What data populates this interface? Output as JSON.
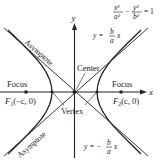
{
  "diagram": {
    "equation": {
      "x_term_num": "x²",
      "x_term_den": "a²",
      "minus": "−",
      "y_term_num": "y²",
      "y_term_den": "b²",
      "rhs": "= 1"
    },
    "axes": {
      "x_label": "x",
      "y_label": "y"
    },
    "labels": {
      "center": "Center",
      "vertex": "Vertex",
      "focus_left": "Focus",
      "focus_right": "Focus",
      "f1": "F",
      "f1_sub": "1",
      "f1_coords": "(−c, 0)",
      "f2": "F",
      "f2_sub": "2",
      "f2_coords": "(c, 0)",
      "asymptote_upper": "Asymptote",
      "asymptote_lower": "Asymptote"
    },
    "asymptote_pos": {
      "lhs": "y =",
      "num": "b",
      "den": "a",
      "var": "x"
    },
    "asymptote_neg": {
      "lhs": "y = −",
      "num": "b",
      "den": "a",
      "var": "x"
    },
    "colors": {
      "line": "#222222",
      "background": "#ffffff"
    }
  }
}
